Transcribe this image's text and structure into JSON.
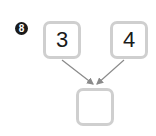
{
  "problem": {
    "number": "8"
  },
  "inputs": [
    {
      "value": "3"
    },
    {
      "value": "4"
    }
  ],
  "result": {
    "value": ""
  },
  "colors": {
    "box_border": "#cfcfcf",
    "arrow": "#8a8a8a",
    "badge_bg": "#1a1a1a"
  }
}
